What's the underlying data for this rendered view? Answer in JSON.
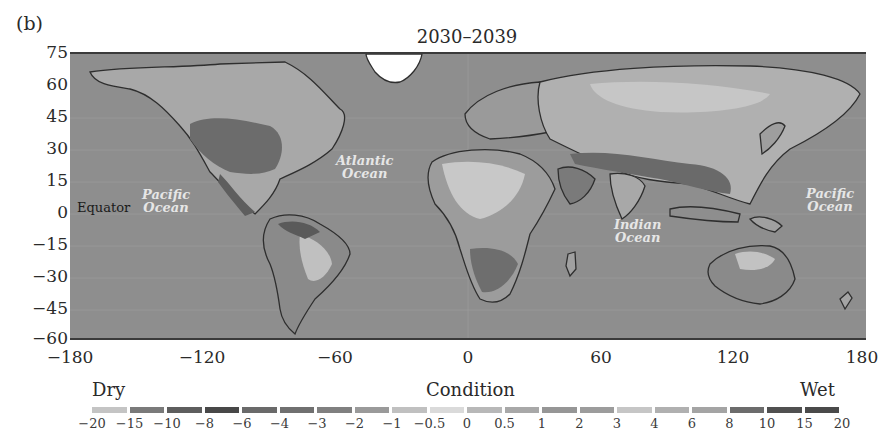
{
  "panel_label": "(b)",
  "title": "2030–2039",
  "map": {
    "projection": "equirectangular",
    "lon_range": [
      -180,
      180
    ],
    "lat_range": [
      -60,
      75
    ],
    "ocean_color": "#8e8e8e",
    "greenland_color": "#ffffff",
    "y_ticks": [
      "75",
      "60",
      "45",
      "30",
      "15",
      "0",
      "−15",
      "−30",
      "−45",
      "−60"
    ],
    "x_ticks": [
      "−180",
      "−120",
      "−60",
      "0",
      "60",
      "120",
      "180"
    ],
    "labels": {
      "equator": "Equator",
      "pacific_west_line1": "Pacific",
      "pacific_west_line2": "Ocean",
      "atlantic_line1": "Atlantic",
      "atlantic_line2": "Ocean",
      "indian_line1": "Indian",
      "indian_line2": "Ocean",
      "pacific_east_line1": "Pacific",
      "pacific_east_line2": "Ocean"
    }
  },
  "legend": {
    "title": "Condition",
    "left_label": "Dry",
    "right_label": "Wet",
    "ticks": [
      "−20",
      "−15",
      "−10",
      "−8",
      "−6",
      "−4",
      "−3",
      "−2",
      "−1",
      "−0.5",
      "0",
      "0.5",
      "1",
      "2",
      "3",
      "4",
      "6",
      "8",
      "10",
      "15",
      "20"
    ],
    "swatches": [
      "#c4c4c4",
      "#7a7a7a",
      "#5e5e5e",
      "#484848",
      "#6a6a6a",
      "#707070",
      "#808080",
      "#9a9a9a",
      "#c0c0c0",
      "#dadada",
      "#b8b8b8",
      "#a8a8a8",
      "#969696",
      "#9c9c9c",
      "#c6c6c6",
      "#b0b0b0",
      "#a4a4a4",
      "#6c6c6c",
      "#505050",
      "#4a4a4a"
    ]
  }
}
